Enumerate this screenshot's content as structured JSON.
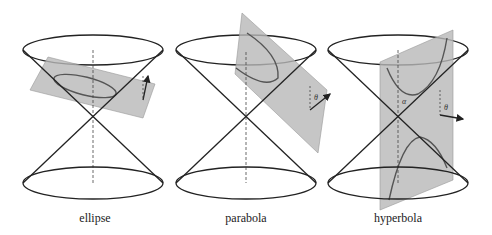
{
  "figure": {
    "panels": [
      {
        "id": "ellipse",
        "caption": "ellipse",
        "angle_labels": []
      },
      {
        "id": "parabola",
        "caption": "parabola",
        "angle_labels": [
          "θ"
        ]
      },
      {
        "id": "hyperbola",
        "caption": "hyperbola",
        "angle_labels": [
          "α",
          "θ"
        ]
      }
    ]
  },
  "colors": {
    "stroke": "#222222",
    "plane": "#b8b8b8",
    "curve": "#555555",
    "background": "#ffffff"
  }
}
